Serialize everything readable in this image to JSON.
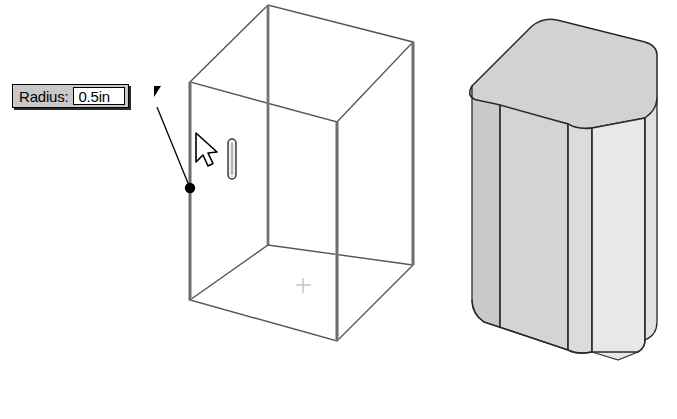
{
  "app": {
    "context": "cad-3d-modeling-viewport",
    "background_color": "#ffffff"
  },
  "callout": {
    "label": "Radius:",
    "value": "0.5in",
    "placeholder": "0.5in",
    "label_bg": "#c8c8c8",
    "field_bg": "#ffffff",
    "border_color": "#000000"
  },
  "viewport": {
    "wireframe_model": {
      "name": "fillet-preview-wireframe-box",
      "description": "Isometric wireframe box with vertical edges selected for fillet",
      "edge_color": "#4a4a4a",
      "highlight_edge_color": "#8c8c8c",
      "origin_marker": "+",
      "origin_marker_color": "#bdbdbd"
    },
    "solid_model": {
      "name": "filleted-solid-box",
      "description": "Shaded box result with rounded vertical edges",
      "top_face_color": "#d2d2d2",
      "left_face_color": "#cccccc",
      "front_face_color": "#d8d8d8",
      "right_face_color": "#e8e8e8",
      "outline_color": "#2a2a2a"
    },
    "cursor": {
      "name": "arrow-pointer",
      "fill": "#ffffff",
      "stroke": "#000000"
    },
    "selection_point": {
      "name": "selected-edge-handle",
      "color": "#000000"
    },
    "fillet_handle": {
      "name": "fillet-radius-handle",
      "color": "#3d3d3d"
    },
    "leader_line": {
      "color": "#000000"
    }
  }
}
